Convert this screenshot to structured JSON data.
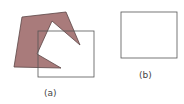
{
  "figure": {
    "panel_a": {
      "label": "(a)",
      "polygon_fill": "#a97b7b",
      "polygon_stroke": "#5a4545",
      "clip_rect_stroke": "#555555"
    },
    "panel_b": {
      "label": "(b)",
      "polygon_fill": "#a97b7b",
      "clip_rect_stroke": "#555555"
    }
  }
}
